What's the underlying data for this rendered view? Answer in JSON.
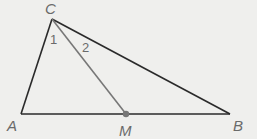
{
  "figure": {
    "type": "triangle-with-median",
    "triangle": [
      "A",
      "B",
      "C"
    ],
    "median": {
      "from": "C",
      "to": "M",
      "on_side": "AB"
    },
    "points": {
      "A": {
        "label": "A",
        "x": 21,
        "y": 114
      },
      "B": {
        "label": "B",
        "x": 230,
        "y": 114
      },
      "C": {
        "label": "C",
        "x": 52,
        "y": 19
      },
      "M": {
        "label": "M",
        "x": 126,
        "y": 114
      }
    },
    "angle_labels": [
      {
        "label": "1",
        "between": [
          "CA",
          "CM"
        ]
      },
      {
        "label": "2",
        "between": [
          "CM",
          "CB"
        ]
      }
    ],
    "colors": {
      "background": "#efefed",
      "sides": "#2a2a2a",
      "median": "#777777",
      "point_m": "#777777",
      "labels": "#6a6a6a"
    }
  }
}
